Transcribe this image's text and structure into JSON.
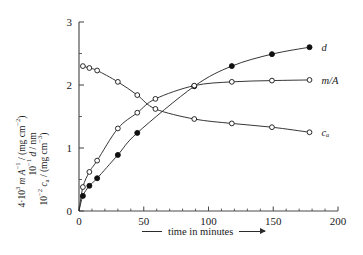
{
  "chart_data": {
    "type": "line",
    "title": "",
    "xlabel": "time in minutes",
    "ylabel_lines": [
      "10⁻¹ d / nm",
      "4·10³ m A⁻¹ / (mg cm⁻²)",
      "10⁻² cₐ / (mg cm⁻³)"
    ],
    "xlim": [
      0,
      200
    ],
    "ylim": [
      0,
      3
    ],
    "xticks": [
      0,
      50,
      100,
      150,
      200
    ],
    "xticklabels": [
      "0",
      "50",
      "100",
      "150",
      "200"
    ],
    "yticks": [
      0,
      1,
      2,
      3
    ],
    "yticklabels": [
      "0",
      "1",
      "2",
      "3"
    ],
    "x_minor_ticks": [
      10,
      20,
      30,
      40,
      60,
      70,
      80,
      90,
      110,
      120,
      130,
      140,
      160,
      170,
      180,
      190
    ],
    "y_minor_ticks": [
      0.5,
      1.5,
      2.5
    ],
    "grid": false,
    "legend_position": "right-inline",
    "series": [
      {
        "name": "d",
        "label": "d",
        "marker": "filled-circle",
        "points": [
          {
            "x": 3,
            "y": 0.24
          },
          {
            "x": 8,
            "y": 0.4
          },
          {
            "x": 14,
            "y": 0.52
          },
          {
            "x": 30,
            "y": 0.89
          },
          {
            "x": 45,
            "y": 1.24
          },
          {
            "x": 89,
            "y": 1.98
          },
          {
            "x": 118,
            "y": 2.3
          },
          {
            "x": 149,
            "y": 2.49
          },
          {
            "x": 178,
            "y": 2.6
          }
        ]
      },
      {
        "name": "m/A",
        "label": "m/A",
        "marker": "open-circle",
        "points": [
          {
            "x": 3,
            "y": 0.38
          },
          {
            "x": 8,
            "y": 0.62
          },
          {
            "x": 14,
            "y": 0.8
          },
          {
            "x": 30,
            "y": 1.31
          },
          {
            "x": 45,
            "y": 1.56
          },
          {
            "x": 59,
            "y": 1.78
          },
          {
            "x": 89,
            "y": 1.99
          },
          {
            "x": 118,
            "y": 2.05
          },
          {
            "x": 149,
            "y": 2.07
          },
          {
            "x": 178,
            "y": 2.08
          }
        ]
      },
      {
        "name": "c_a",
        "label": "cₐ",
        "marker": "open-circle",
        "points": [
          {
            "x": 3,
            "y": 2.3
          },
          {
            "x": 8,
            "y": 2.27
          },
          {
            "x": 14,
            "y": 2.23
          },
          {
            "x": 30,
            "y": 2.05
          },
          {
            "x": 45,
            "y": 1.84
          },
          {
            "x": 59,
            "y": 1.62
          },
          {
            "x": 89,
            "y": 1.46
          },
          {
            "x": 118,
            "y": 1.39
          },
          {
            "x": 149,
            "y": 1.33
          },
          {
            "x": 178,
            "y": 1.25
          }
        ]
      }
    ]
  },
  "axis": {
    "x_caption": "time in minutes"
  }
}
